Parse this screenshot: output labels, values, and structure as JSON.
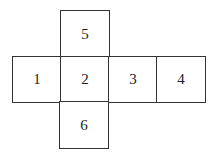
{
  "diagram": {
    "type": "cube-net",
    "faces": [
      {
        "label": "5",
        "row": 0,
        "col": 1
      },
      {
        "label": "1",
        "row": 1,
        "col": 0
      },
      {
        "label": "2",
        "row": 1,
        "col": 1
      },
      {
        "label": "3",
        "row": 1,
        "col": 2
      },
      {
        "label": "4",
        "row": 1,
        "col": 3
      },
      {
        "label": "6",
        "row": 2,
        "col": 1
      }
    ]
  }
}
